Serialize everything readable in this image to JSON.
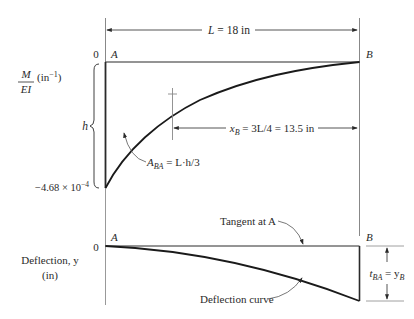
{
  "dimension": {
    "length_label": "L = 18 in",
    "xb_label_main": "x",
    "xb_label_sub": "B",
    "xb_label_rest": " = 3L/4 = 13.5 in"
  },
  "moment_diagram": {
    "ylabel_num": "M",
    "ylabel_den": "EI",
    "ylabel_units": "(in",
    "ylabel_units_exp": "−1",
    "ylabel_units_close": ")",
    "zero_label": "0",
    "point_a": "A",
    "point_b": "B",
    "h_label": "h",
    "min_value_base": "−4.68 × 10",
    "min_value_exp": "−4",
    "area_label_main": "A",
    "area_label_sub": "BA",
    "area_label_rest": " = L·h/3"
  },
  "deflection_diagram": {
    "ylabel_line1": "Deflection, y",
    "ylabel_line2": "(in)",
    "zero_label": "0",
    "point_a": "A",
    "point_b": "B",
    "tangent_label": "Tangent at A",
    "curve_label": "Deflection curve",
    "tba_main": "t",
    "tba_sub": "BA",
    "tba_eq": " = y",
    "tba_sub2": "B"
  },
  "colors": {
    "line": "#2a2a2a",
    "axis": "#999999"
  }
}
